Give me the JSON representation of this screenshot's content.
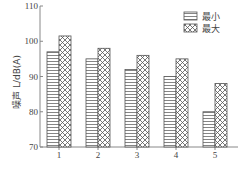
{
  "chart_data": {
    "type": "bar",
    "title": "",
    "xlabel": "",
    "ylabel": "噪声 L/dB(A)",
    "categories": [
      "1",
      "2",
      "3",
      "4",
      "5"
    ],
    "series": [
      {
        "name": "最小",
        "pattern": "horizontal-lines",
        "values": [
          97,
          95,
          92,
          90,
          80
        ]
      },
      {
        "name": "最大",
        "pattern": "crosshatch",
        "values": [
          101.5,
          98,
          96,
          95,
          88
        ]
      }
    ],
    "ylim": [
      70,
      110
    ],
    "yticks": [
      70,
      80,
      90,
      100,
      110
    ],
    "grid": false,
    "legend_position": "upper right"
  },
  "colors": {
    "axis": "#888888",
    "bar_stroke": "#555555",
    "fill": "#ffffff"
  }
}
